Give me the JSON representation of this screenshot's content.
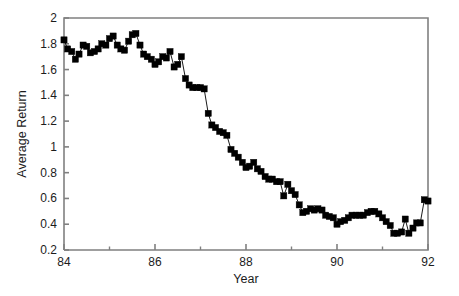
{
  "figure": {
    "background_color": "#ffffff",
    "axis_color": "#808080",
    "series_color": "#000000"
  },
  "axes": {
    "y_title": "Average Return",
    "x_title": "Year",
    "y_ticks": [
      "0.2",
      "0.4",
      "0.6",
      "0.8",
      "1",
      "1.2",
      "1.4",
      "1.6",
      "1.8",
      "2"
    ],
    "x_ticks": [
      "84",
      "86",
      "88",
      "90",
      "92"
    ],
    "x_minor_ticks": [
      "85",
      "87",
      "89",
      "91"
    ]
  },
  "chart_data": {
    "type": "line",
    "title": "",
    "xlabel": "Year",
    "ylabel": "Average Return",
    "xlim": [
      84,
      92
    ],
    "ylim": [
      0.2,
      2
    ],
    "grid": false,
    "legend": null,
    "marker": "square",
    "series": [
      {
        "name": "Average Return",
        "x": [
          84.0,
          84.08,
          84.17,
          84.25,
          84.33,
          84.42,
          84.5,
          84.58,
          84.67,
          84.75,
          84.83,
          84.92,
          85.0,
          85.08,
          85.17,
          85.25,
          85.33,
          85.42,
          85.5,
          85.58,
          85.67,
          85.75,
          85.83,
          85.92,
          86.0,
          86.08,
          86.17,
          86.25,
          86.33,
          86.42,
          86.5,
          86.58,
          86.67,
          86.75,
          86.83,
          86.92,
          87.0,
          87.08,
          87.17,
          87.25,
          87.33,
          87.42,
          87.5,
          87.58,
          87.67,
          87.75,
          87.83,
          87.92,
          88.0,
          88.08,
          88.17,
          88.25,
          88.33,
          88.42,
          88.5,
          88.58,
          88.67,
          88.75,
          88.83,
          88.92,
          89.0,
          89.08,
          89.17,
          89.25,
          89.33,
          89.42,
          89.5,
          89.58,
          89.67,
          89.75,
          89.83,
          89.92,
          90.0,
          90.08,
          90.17,
          90.25,
          90.33,
          90.42,
          90.5,
          90.58,
          90.67,
          90.75,
          90.83,
          90.92,
          91.0,
          91.08,
          91.17,
          91.25,
          91.33,
          91.42,
          91.5,
          91.58,
          91.67,
          91.75,
          91.83,
          91.92
        ],
        "values": [
          1.83,
          1.76,
          1.74,
          1.68,
          1.72,
          1.79,
          1.78,
          1.73,
          1.74,
          1.76,
          1.8,
          1.79,
          1.84,
          1.86,
          1.79,
          1.76,
          1.75,
          1.82,
          1.87,
          1.88,
          1.79,
          1.72,
          1.7,
          1.68,
          1.64,
          1.66,
          1.7,
          1.69,
          1.74,
          1.62,
          1.64,
          1.7,
          1.53,
          1.48,
          1.46,
          1.46,
          1.46,
          1.45,
          1.26,
          1.17,
          1.15,
          1.12,
          1.11,
          1.09,
          0.98,
          0.95,
          0.92,
          0.88,
          0.84,
          0.85,
          0.88,
          0.83,
          0.81,
          0.77,
          0.75,
          0.75,
          0.73,
          0.73,
          0.62,
          0.71,
          0.66,
          0.63,
          0.55,
          0.49,
          0.5,
          0.52,
          0.51,
          0.52,
          0.51,
          0.47,
          0.46,
          0.45,
          0.4,
          0.42,
          0.43,
          0.45,
          0.47,
          0.47,
          0.47,
          0.47,
          0.49,
          0.5,
          0.5,
          0.48,
          0.45,
          0.42,
          0.39,
          0.33,
          0.33,
          0.34,
          0.44,
          0.33,
          0.37,
          0.41,
          0.44,
          0.43
        ]
      }
    ],
    "extra_points": {
      "note": "tail rises to 0.59 near 91.8",
      "x": [
        91.75,
        91.83,
        91.92,
        92.0
      ],
      "values": [
        0.41,
        0.41,
        0.59,
        0.58
      ]
    }
  }
}
